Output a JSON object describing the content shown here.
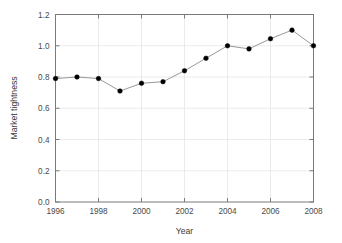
{
  "chart_data": {
    "type": "line",
    "title": "",
    "xlabel": "Year",
    "ylabel": "Market tightness",
    "x": [
      1996,
      1997,
      1998,
      1999,
      2000,
      2001,
      2002,
      2003,
      2004,
      2005,
      2006,
      2007,
      2008
    ],
    "values": [
      0.79,
      0.8,
      0.79,
      0.71,
      0.76,
      0.77,
      0.84,
      0.92,
      1.0,
      0.98,
      1.045,
      1.1,
      1.0
    ],
    "series": [
      {
        "name": "Market tightness",
        "values": [
          0.79,
          0.8,
          0.79,
          0.71,
          0.76,
          0.77,
          0.84,
          0.92,
          1.0,
          0.98,
          1.045,
          1.1,
          1.0
        ]
      }
    ],
    "xlim": [
      1996,
      2008
    ],
    "ylim": [
      0.0,
      1.2
    ],
    "xticks": [
      1996,
      1998,
      2000,
      2002,
      2004,
      2006,
      2008
    ],
    "xtick_labels": [
      "1996",
      "1998",
      "2000",
      "2002",
      "2004",
      "2006",
      "2008"
    ],
    "yticks": [
      0.0,
      0.2,
      0.4,
      0.6,
      0.8,
      1.0,
      1.2
    ],
    "ytick_labels": [
      "0.0",
      "0.2",
      "0.4",
      "0.6",
      "0.8",
      "1.0",
      "1.2"
    ],
    "grid": true,
    "grid_color": "#e6e6e6",
    "legend": false,
    "legend_position": "none",
    "line_color": "#8c8c8c",
    "marker_color": "#000000",
    "marker": "circle",
    "frame": "box",
    "frame_color": "#7a7a7a",
    "background": "#ffffff"
  }
}
